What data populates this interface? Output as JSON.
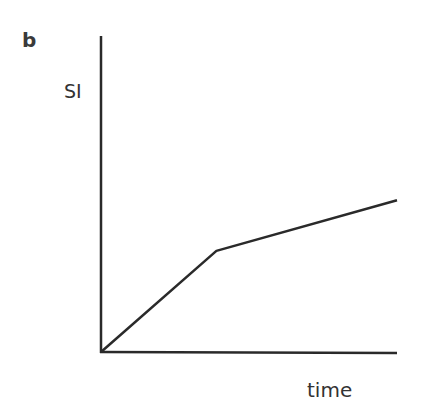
{
  "figure": {
    "panel_label": "b",
    "y_axis_label": "SI",
    "x_axis_label": "time"
  },
  "chart_data": {
    "type": "line",
    "title": "",
    "panel": "b",
    "xlabel": "time",
    "ylabel": "SI",
    "grid": false,
    "legend": null,
    "ticks": "none",
    "series": [
      {
        "name": "SI",
        "points": [
          {
            "x": 0,
            "y": 0
          },
          {
            "x": 0.39,
            "y": 0.32
          },
          {
            "x": 1.0,
            "y": 0.48
          }
        ]
      }
    ],
    "xlim": [
      0,
      1
    ],
    "ylim": [
      0,
      1
    ]
  },
  "layout": {
    "line_color": "#2a2a2a"
  }
}
